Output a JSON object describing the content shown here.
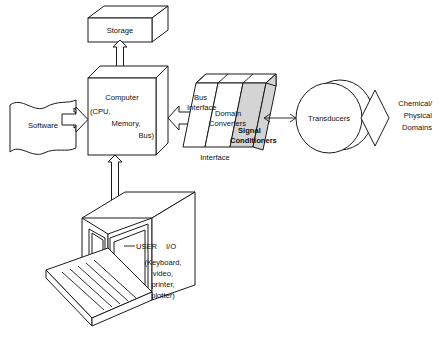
{
  "diagram": {
    "nodes": {
      "storage": {
        "label": "Storage"
      },
      "software": {
        "label": "Software"
      },
      "computer": {
        "label": "Computer",
        "detail_line1": "(CPU,",
        "detail_line2": "Memory,",
        "detail_line3": "Bus)"
      },
      "interface": {
        "caption": "Interface",
        "slab1_line1": "Bus",
        "slab1_line2": "Interface",
        "slab2_line1": "Domain",
        "slab2_line2": "Converters",
        "slab3_line1": "Signal",
        "slab3_line2": "Conditioners"
      },
      "transducers": {
        "label": "Transducers"
      },
      "domains": {
        "line1": "Chemical/",
        "line2": "Physical",
        "line3": "Domains"
      },
      "workstation": {
        "label_user": "USER",
        "label_io": "I/O",
        "detail_line1": "(Keyboard,",
        "detail_line2": "video,",
        "detail_line3": "printer,",
        "detail_line4": "plotter)"
      }
    },
    "colors": {
      "stroke": "#1a1a1a",
      "fill": "#ffffff",
      "shaded_slab": "#d4d4d4",
      "background": "#ffffff"
    }
  }
}
